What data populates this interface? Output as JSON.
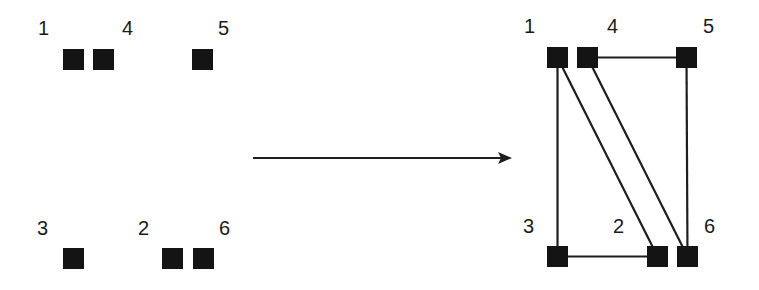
{
  "diagram": {
    "type": "graph-transformation",
    "node_size": 21,
    "colors": {
      "node": "#141414",
      "edge": "#1e1e1e",
      "label": "#1a1a1a",
      "background": "#ffffff"
    },
    "left_graph": {
      "nodes": [
        {
          "id": "1",
          "label": "1",
          "x": 63,
          "y": 49,
          "lx": 38,
          "ly": 35
        },
        {
          "id": "4",
          "label": "4",
          "x": 93,
          "y": 49,
          "lx": 122,
          "ly": 35
        },
        {
          "id": "5",
          "label": "5",
          "x": 192,
          "y": 49,
          "lx": 218,
          "ly": 35
        },
        {
          "id": "3",
          "label": "3",
          "x": 63,
          "y": 248,
          "lx": 37,
          "ly": 235
        },
        {
          "id": "2",
          "label": "2",
          "x": 162,
          "y": 248,
          "lx": 138,
          "ly": 235
        },
        {
          "id": "6",
          "label": "6",
          "x": 193,
          "y": 248,
          "lx": 219,
          "ly": 235
        }
      ],
      "edges": []
    },
    "arrow": {
      "x1": 253,
      "y1": 158,
      "x2": 510,
      "y2": 158
    },
    "right_graph": {
      "nodes": [
        {
          "id": "1",
          "label": "1",
          "x": 547,
          "y": 47,
          "lx": 524,
          "ly": 33
        },
        {
          "id": "4",
          "label": "4",
          "x": 577,
          "y": 47,
          "lx": 607,
          "ly": 33
        },
        {
          "id": "5",
          "label": "5",
          "x": 676,
          "y": 47,
          "lx": 703,
          "ly": 33
        },
        {
          "id": "3",
          "label": "3",
          "x": 547,
          "y": 246,
          "lx": 523,
          "ly": 233
        },
        {
          "id": "2",
          "label": "2",
          "x": 647,
          "y": 246,
          "lx": 613,
          "ly": 233
        },
        {
          "id": "6",
          "label": "6",
          "x": 677,
          "y": 246,
          "lx": 704,
          "ly": 233
        }
      ],
      "edges": [
        {
          "from": "1",
          "to": "3"
        },
        {
          "from": "1",
          "to": "2"
        },
        {
          "from": "4",
          "to": "6"
        },
        {
          "from": "4",
          "to": "5"
        },
        {
          "from": "5",
          "to": "6"
        },
        {
          "from": "3",
          "to": "2"
        }
      ]
    }
  }
}
